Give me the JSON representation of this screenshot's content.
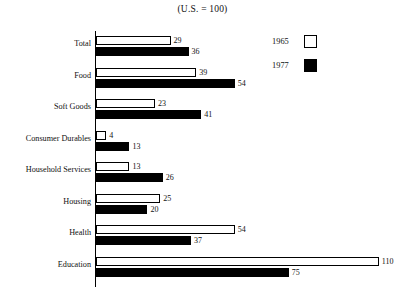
{
  "chart_data": {
    "type": "bar",
    "orientation": "horizontal",
    "title": "(U.S. = 100)",
    "xlabel": "",
    "ylabel": "",
    "xlim": [
      0,
      115
    ],
    "grid": false,
    "legend_position": "top-right",
    "categories": [
      "Total",
      "Food",
      "Soft Goods",
      "Consumer Durables",
      "Household Services",
      "Housing",
      "Health",
      "Education"
    ],
    "series": [
      {
        "name": "1965",
        "color": "#ffffff",
        "values": [
          29,
          39,
          23,
          4,
          13,
          25,
          54,
          110
        ]
      },
      {
        "name": "1977",
        "color": "#000000",
        "values": [
          36,
          54,
          41,
          13,
          26,
          20,
          37,
          75
        ]
      }
    ]
  },
  "legend": {
    "items": [
      {
        "label": "1965",
        "swatch": "light"
      },
      {
        "label": "1977",
        "swatch": "dark"
      }
    ]
  },
  "scale": {
    "px_per_unit": 2.57,
    "baseline_x": 95
  }
}
